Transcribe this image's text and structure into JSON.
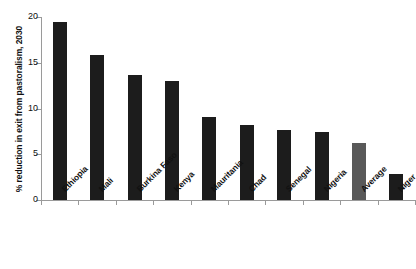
{
  "chart_data": {
    "type": "bar",
    "title": "",
    "xlabel": "",
    "ylabel": "% reduction in exit from pastoralism, 2030",
    "ylim": [
      0,
      20
    ],
    "yticks": [
      0,
      5,
      10,
      15,
      20
    ],
    "ytick_labels": [
      "0",
      "5",
      "10",
      "15",
      "20"
    ],
    "grid": false,
    "legend": "none",
    "categories": [
      "Ethiopia",
      "Mali",
      "Burkina Faso",
      "Kenya",
      "Mauritania",
      "Chad",
      "Senegal",
      "Nigeria",
      "Average",
      "Niger"
    ],
    "values": [
      19.5,
      15.8,
      13.7,
      13.0,
      9.1,
      8.2,
      7.6,
      7.4,
      6.2,
      2.8
    ],
    "bar_colors": [
      "#1c1c1c",
      "#1c1c1c",
      "#1c1c1c",
      "#1c1c1c",
      "#1c1c1c",
      "#1c1c1c",
      "#1c1c1c",
      "#1c1c1c",
      "#595959",
      "#1c1c1c"
    ],
    "colors": {
      "bar_default": "#1c1c1c",
      "bar_highlight": "#595959",
      "axis": "#9a9a9a",
      "text": "#111111",
      "background": "#ffffff"
    }
  }
}
